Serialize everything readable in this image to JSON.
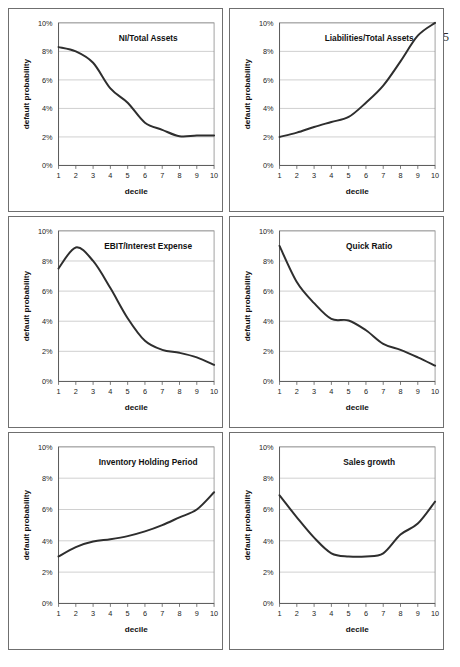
{
  "page": {
    "page_number": "5",
    "bottom_caption_fragment": ""
  },
  "axes": {
    "ylabel": "default probability",
    "xlabel": "decile",
    "y_ticks": [
      "0%",
      "2%",
      "4%",
      "6%",
      "8%",
      "10%"
    ],
    "x_ticks": [
      "1",
      "2",
      "3",
      "4",
      "5",
      "6",
      "7",
      "8",
      "9",
      "10"
    ]
  },
  "chart_data": [
    {
      "type": "line",
      "title": "NI/Total Assets",
      "xlabel": "decile",
      "ylabel": "default probability",
      "categories": [
        1,
        2,
        3,
        4,
        5,
        6,
        7,
        8,
        9,
        10
      ],
      "values": [
        8.3,
        8.0,
        7.2,
        5.4,
        4.4,
        3.0,
        2.5,
        2.05,
        2.1,
        2.1
      ],
      "ylim": [
        0,
        10
      ],
      "xlim": [
        1,
        10
      ],
      "grid": true,
      "legend": "none"
    },
    {
      "type": "line",
      "title": "Liabilities/Total Assets",
      "xlabel": "decile",
      "ylabel": "default probability",
      "categories": [
        1,
        2,
        3,
        4,
        5,
        6,
        7,
        8,
        9,
        10
      ],
      "values": [
        2.0,
        2.3,
        2.7,
        3.05,
        3.4,
        4.4,
        5.6,
        7.3,
        9.1,
        10.0
      ],
      "ylim": [
        0,
        10
      ],
      "xlim": [
        1,
        10
      ],
      "grid": true,
      "legend": "none"
    },
    {
      "type": "line",
      "title": "EBIT/Interest Expense",
      "xlabel": "decile",
      "ylabel": "default probability",
      "categories": [
        1,
        2,
        3,
        4,
        5,
        6,
        7,
        8,
        9,
        10
      ],
      "values": [
        7.5,
        8.9,
        8.0,
        6.2,
        4.2,
        2.7,
        2.1,
        1.9,
        1.6,
        1.1
      ],
      "ylim": [
        0,
        10
      ],
      "xlim": [
        1,
        10
      ],
      "grid": true,
      "legend": "none"
    },
    {
      "type": "line",
      "title": "Quick Ratio",
      "xlabel": "decile",
      "ylabel": "default probability",
      "categories": [
        1,
        2,
        3,
        4,
        5,
        6,
        7,
        8,
        9,
        10
      ],
      "values": [
        9.0,
        6.6,
        5.2,
        4.15,
        4.05,
        3.4,
        2.5,
        2.1,
        1.6,
        1.05
      ],
      "ylim": [
        0,
        10
      ],
      "xlim": [
        1,
        10
      ],
      "grid": true,
      "legend": "none"
    },
    {
      "type": "line",
      "title": "Inventory Holding Period",
      "xlabel": "decile",
      "ylabel": "default probability",
      "categories": [
        1,
        2,
        3,
        4,
        5,
        6,
        7,
        8,
        9,
        10
      ],
      "values": [
        3.0,
        3.6,
        3.95,
        4.1,
        4.3,
        4.6,
        5.0,
        5.5,
        6.0,
        7.1
      ],
      "ylim": [
        0,
        10
      ],
      "xlim": [
        1,
        10
      ],
      "grid": true,
      "legend": "none"
    },
    {
      "type": "line",
      "title": "Sales growth",
      "xlabel": "decile",
      "ylabel": "default probability",
      "categories": [
        1,
        2,
        3,
        4,
        5,
        6,
        7,
        8,
        9,
        10
      ],
      "values": [
        6.9,
        5.5,
        4.2,
        3.2,
        3.0,
        3.0,
        3.2,
        4.4,
        5.1,
        6.5
      ],
      "ylim": [
        0,
        10
      ],
      "xlim": [
        1,
        10
      ],
      "grid": true,
      "legend": "none"
    }
  ]
}
